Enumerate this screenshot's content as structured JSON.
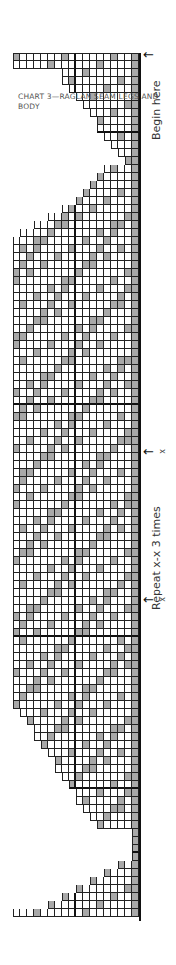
{
  "chart_title": "CHART 3—RAGLAN SEAM LEGS AND BODY",
  "labels": {
    "begin": "Begin here",
    "repeat": "Repeat x-x 3 times",
    "x_mark": "x",
    "arrow": "←"
  },
  "colors": {
    "shade": "#a8a8a8",
    "grid": "#222222",
    "text": "#555555"
  },
  "chart_data": {
    "type": "table",
    "title": "CHART 3—RAGLAN SEAM LEGS AND BODY",
    "columns": 18,
    "rows": 108,
    "legend": [
      {
        "name": "shaded stitch",
        "color": "#a8a8a8"
      },
      {
        "name": "plain stitch",
        "color": "#ffffff"
      }
    ],
    "annotations": [
      "Begin here",
      "Repeat x-x 3 times",
      "x",
      "x"
    ],
    "sections": [
      {
        "name": "top-cuff",
        "rows": "1-2",
        "width": 18
      },
      {
        "name": "top-taper",
        "rows": "3-14",
        "width": "decreasing 11 to 1"
      },
      {
        "name": "upper-motif",
        "rows": "15-43",
        "width": "5 to 18"
      },
      {
        "name": "repeat-block",
        "rows": "44-72",
        "width": 18
      },
      {
        "name": "lower-motif",
        "rows": "73-100",
        "width": "18 to 5"
      },
      {
        "name": "bottom-taper",
        "rows": "101-108",
        "width": "1 to 18"
      }
    ]
  }
}
